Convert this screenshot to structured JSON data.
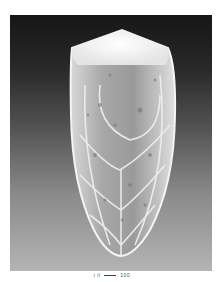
{
  "figure": {
    "background_gradient": [
      "#161616",
      "#b4b4b4"
    ],
    "specimen_color": "#e8e8e8",
    "specimen_shadow_color": "#8c8c8c"
  },
  "caption": {
    "left_text": "i  il",
    "right_text": "100"
  }
}
